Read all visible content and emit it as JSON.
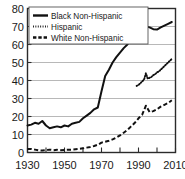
{
  "chart_data": {
    "type": "line",
    "title": "",
    "subtitle": "",
    "xlabel": "",
    "ylabel": "",
    "xlim": [
      1930,
      2010
    ],
    "ylim": [
      0,
      80
    ],
    "grid": true,
    "legend_position": "top-left",
    "xticks": [
      1930,
      1940,
      1950,
      1960,
      1970,
      1980,
      1990,
      2000,
      2010
    ],
    "xtick_labels": [
      "1930",
      "",
      "1950",
      "",
      "1970",
      "",
      "1990",
      "",
      "2010"
    ],
    "yticks": [
      0,
      10,
      20,
      30,
      40,
      50,
      60,
      70,
      80
    ],
    "ytick_labels": [
      "0",
      "10",
      "20",
      "30",
      "40",
      "50",
      "60",
      "70",
      "80"
    ],
    "series": [
      {
        "name": "Black Non-Hispanic",
        "style": "solid",
        "x": [
          1930,
          1932,
          1934,
          1936,
          1938,
          1940,
          1942,
          1944,
          1946,
          1948,
          1950,
          1952,
          1954,
          1956,
          1958,
          1960,
          1962,
          1964,
          1966,
          1968,
          1970,
          1972,
          1974,
          1976,
          1978,
          1980,
          1982,
          1984,
          1986,
          1988,
          1990,
          1992,
          1994,
          1996,
          1998,
          2000,
          2002,
          2004,
          2006,
          2008
        ],
        "values": [
          15.0,
          15.5,
          16.5,
          16.0,
          17.5,
          15.0,
          13.5,
          14.0,
          14.5,
          14.0,
          15.0,
          14.5,
          16.0,
          16.5,
          17.0,
          19.0,
          20.5,
          22.0,
          24.0,
          25.0,
          34.0,
          42.5,
          46.0,
          50.0,
          53.0,
          55.5,
          58.0,
          60.0,
          63.0,
          65.5,
          68.0,
          70.5,
          70.0,
          69.5,
          68.5,
          68.3,
          69.5,
          70.5,
          71.5,
          72.5
        ]
      },
      {
        "name": "Hispanic",
        "style": "dotted",
        "x": [
          1989,
          1990,
          1991,
          1992,
          1993,
          1994,
          1995,
          1996,
          1997,
          1998,
          1999,
          2000,
          2001,
          2002,
          2003,
          2004,
          2005,
          2006,
          2007,
          2008
        ],
        "values": [
          37.0,
          37.5,
          38.5,
          39.5,
          40.5,
          44.0,
          41.0,
          41.5,
          42.0,
          43.0,
          43.5,
          44.5,
          45.0,
          46.0,
          47.0,
          48.0,
          49.0,
          50.0,
          51.0,
          52.0
        ]
      },
      {
        "name": "White Non-Hispanic",
        "style": "dashed",
        "x": [
          1930,
          1932,
          1934,
          1936,
          1938,
          1940,
          1942,
          1944,
          1946,
          1948,
          1950,
          1952,
          1954,
          1956,
          1958,
          1960,
          1962,
          1964,
          1966,
          1968,
          1970,
          1972,
          1974,
          1976,
          1978,
          1980,
          1982,
          1984,
          1986,
          1988,
          1990,
          1992,
          1994,
          1996,
          1998,
          2000,
          2002,
          2004,
          2006,
          2008
        ],
        "values": [
          2.0,
          2.0,
          1.6,
          1.2,
          1.1,
          1.3,
          1.6,
          1.3,
          1.5,
          1.3,
          1.4,
          1.5,
          1.6,
          1.8,
          2.0,
          2.3,
          2.7,
          3.1,
          3.6,
          4.3,
          5.5,
          6.0,
          6.5,
          7.3,
          8.3,
          9.5,
          11.0,
          12.5,
          14.5,
          16.5,
          19.0,
          21.0,
          26.0,
          22.5,
          23.0,
          24.0,
          25.5,
          26.5,
          27.5,
          29.0
        ]
      }
    ]
  },
  "legend": {
    "entries": [
      {
        "label": "Black Non-Hispanic",
        "marker": "solid-line-swatch"
      },
      {
        "label": "Hispanic",
        "marker": "dotted-line-swatch"
      },
      {
        "label": "White Non-Hispanic",
        "marker": "dashed-line-swatch"
      }
    ]
  }
}
